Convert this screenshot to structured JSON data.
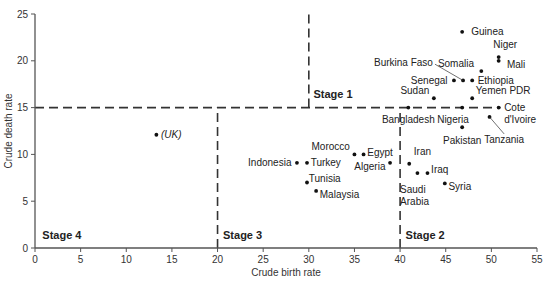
{
  "chart_data": {
    "type": "scatter",
    "title": "",
    "xlabel": "Crude birth rate",
    "ylabel": "Crude death rate",
    "xlim": [
      0,
      55
    ],
    "ylim": [
      0,
      25
    ],
    "x_ticks": [
      0,
      5,
      10,
      15,
      20,
      25,
      30,
      35,
      40,
      45,
      50,
      55
    ],
    "y_ticks": [
      0,
      5,
      10,
      15,
      20,
      25
    ],
    "grid": false,
    "legend": null,
    "points": [
      {
        "label": "Guinea",
        "x": 46.8,
        "y": 23.1,
        "lx": 1.0,
        "ly": 0.0,
        "anchor": "start"
      },
      {
        "label": "Niger",
        "x": 50.8,
        "y": 20.4,
        "lx": -0.6,
        "ly": 1.3,
        "anchor": "start"
      },
      {
        "label": "Mali",
        "x": 50.8,
        "y": 20.0,
        "lx": 0.9,
        "ly": -0.4,
        "anchor": "start"
      },
      {
        "label": "Somalia",
        "x": 48.9,
        "y": 18.9,
        "lx": -0.8,
        "ly": 0.8,
        "anchor": "end"
      },
      {
        "label": "Burkina Faso",
        "x": 46.9,
        "y": 17.9,
        "lx": -3.3,
        "ly": 1.9,
        "anchor": "end",
        "leader": true
      },
      {
        "label": "Senegal",
        "x": 45.9,
        "y": 17.9,
        "lx": -0.7,
        "ly": 0.0,
        "anchor": "end"
      },
      {
        "label": "Ethiopia",
        "x": 47.9,
        "y": 17.9,
        "lx": 0.6,
        "ly": 0.0,
        "anchor": "start"
      },
      {
        "label": "Sudan",
        "x": 43.7,
        "y": 16.0,
        "lx": -0.5,
        "ly": 0.8,
        "anchor": "end"
      },
      {
        "label": "Yemen PDR",
        "x": 47.9,
        "y": 16.0,
        "lx": 0.4,
        "ly": 0.8,
        "anchor": "start"
      },
      {
        "label": "Bangladesh",
        "x": 40.9,
        "y": 15.0,
        "lx": 0.0,
        "ly": -1.3,
        "anchor": "middle"
      },
      {
        "label": "Nigeria",
        "x": 46.8,
        "y": 15.0,
        "lx": -1.0,
        "ly": -1.3,
        "anchor": "middle"
      },
      {
        "label": "Cote d'Ivoire",
        "x": 50.8,
        "y": 15.0,
        "lx": 0.6,
        "ly": 0.0,
        "anchor": "start"
      },
      {
        "label": "Tanzania",
        "x": 49.8,
        "y": 14.0,
        "lx": 1.6,
        "ly": -2.4,
        "anchor": "middle",
        "leader": true
      },
      {
        "label": "Pakistan",
        "x": 46.8,
        "y": 12.9,
        "lx": 0.0,
        "ly": -1.4,
        "anchor": "middle"
      },
      {
        "label": "(UK)",
        "x": 13.3,
        "y": 12.1,
        "lx": 0.5,
        "ly": 0.0,
        "anchor": "start",
        "italic": true
      },
      {
        "label": "Morocco",
        "x": 35.0,
        "y": 10.0,
        "lx": -0.5,
        "ly": 0.8,
        "anchor": "end"
      },
      {
        "label": "Egypt",
        "x": 36.0,
        "y": 10.0,
        "lx": 0.4,
        "ly": 0.2,
        "anchor": "start"
      },
      {
        "label": "Indonesia",
        "x": 28.7,
        "y": 9.1,
        "lx": -0.6,
        "ly": 0.0,
        "anchor": "end"
      },
      {
        "label": "Turkey",
        "x": 29.8,
        "y": 9.1,
        "lx": 0.4,
        "ly": 0.0,
        "anchor": "start"
      },
      {
        "label": "Algeria",
        "x": 38.9,
        "y": 9.1,
        "lx": -0.5,
        "ly": -0.4,
        "anchor": "end"
      },
      {
        "label": "Iran",
        "x": 41.0,
        "y": 9.0,
        "lx": 0.5,
        "ly": 1.3,
        "anchor": "start"
      },
      {
        "label": "Saudi Arabia",
        "x": 41.9,
        "y": 8.0,
        "lx": -1.9,
        "ly": -1.8,
        "anchor": "start",
        "multiline": [
          "Saudi",
          "Arabia"
        ]
      },
      {
        "label": "Iraq",
        "x": 43.0,
        "y": 8.0,
        "lx": 0.4,
        "ly": 0.4,
        "anchor": "start"
      },
      {
        "label": "Syria",
        "x": 44.9,
        "y": 6.9,
        "lx": 0.4,
        "ly": -0.3,
        "anchor": "start"
      },
      {
        "label": "Tunisia",
        "x": 29.8,
        "y": 7.0,
        "lx": 0.2,
        "ly": 0.4,
        "anchor": "start"
      },
      {
        "label": "Malaysia",
        "x": 30.8,
        "y": 6.1,
        "lx": 0.4,
        "ly": -0.4,
        "anchor": "start"
      }
    ],
    "reference_lines": [
      {
        "orientation": "horizontal",
        "y": 15,
        "x_from": 0,
        "x_to": 51,
        "style": "dashed"
      },
      {
        "orientation": "vertical",
        "x": 30,
        "y_from": 15,
        "y_to": 25,
        "style": "dashed"
      },
      {
        "orientation": "vertical",
        "x": 20,
        "y_from": 0,
        "y_to": 15,
        "style": "dashed"
      },
      {
        "orientation": "vertical",
        "x": 40,
        "y_from": 0,
        "y_to": 15,
        "style": "dashed"
      }
    ],
    "annotations": [
      {
        "text": "Stage 1",
        "x": 30.5,
        "y": 16.0
      },
      {
        "text": "Stage 2",
        "x": 40.6,
        "y": 1.0
      },
      {
        "text": "Stage 3",
        "x": 20.6,
        "y": 1.0
      },
      {
        "text": "Stage 4",
        "x": 0.8,
        "y": 1.0
      }
    ]
  }
}
